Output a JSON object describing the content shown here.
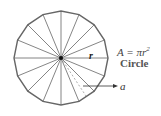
{
  "diagram": {
    "shape": "circle",
    "sectors": 16,
    "center": [
      61,
      58
    ],
    "radius": 47,
    "stroke_color": "#555555",
    "center_dot_color": "#111111",
    "labels": {
      "radius": "r",
      "formula_base": "A = πr",
      "formula_exp": "2",
      "name": "Circle",
      "apothem": "a"
    }
  }
}
